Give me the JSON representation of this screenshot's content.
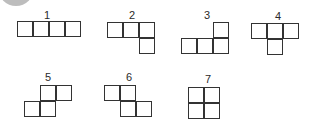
{
  "diagram": {
    "title": "",
    "cell_size_px": 16,
    "stroke_color": "#333333",
    "fill_color": "#ffffff",
    "shapes": [
      {
        "id": 1,
        "label": "1",
        "label_pos": [
          47,
          10
        ],
        "origin": [
          17,
          21
        ],
        "cells": [
          [
            0,
            0
          ],
          [
            1,
            0
          ],
          [
            2,
            0
          ],
          [
            3,
            0
          ]
        ]
      },
      {
        "id": 2,
        "label": "2",
        "label_pos": [
          132,
          10
        ],
        "origin": [
          107,
          22
        ],
        "cells": [
          [
            0,
            0
          ],
          [
            1,
            0
          ],
          [
            2,
            0
          ],
          [
            2,
            1
          ]
        ]
      },
      {
        "id": 3,
        "label": "3",
        "label_pos": [
          207,
          10
        ],
        "origin": [
          181,
          22
        ],
        "cells": [
          [
            2,
            0
          ],
          [
            0,
            1
          ],
          [
            1,
            1
          ],
          [
            2,
            1
          ]
        ]
      },
      {
        "id": 4,
        "label": "4",
        "label_pos": [
          278,
          11
        ],
        "origin": [
          251,
          23
        ],
        "cells": [
          [
            0,
            0
          ],
          [
            1,
            0
          ],
          [
            2,
            0
          ],
          [
            1,
            1
          ]
        ]
      },
      {
        "id": 5,
        "label": "5",
        "label_pos": [
          48,
          72
        ],
        "origin": [
          24,
          85
        ],
        "cells": [
          [
            1,
            0
          ],
          [
            2,
            0
          ],
          [
            0,
            1
          ],
          [
            1,
            1
          ]
        ]
      },
      {
        "id": 6,
        "label": "6",
        "label_pos": [
          129,
          72
        ],
        "origin": [
          104,
          85
        ],
        "cells": [
          [
            0,
            0
          ],
          [
            1,
            0
          ],
          [
            1,
            1
          ],
          [
            2,
            1
          ]
        ]
      },
      {
        "id": 7,
        "label": "7",
        "label_pos": [
          208,
          74
        ],
        "origin": [
          188,
          87
        ],
        "cells": [
          [
            0,
            0
          ],
          [
            1,
            0
          ],
          [
            0,
            1
          ],
          [
            1,
            1
          ]
        ]
      }
    ]
  }
}
